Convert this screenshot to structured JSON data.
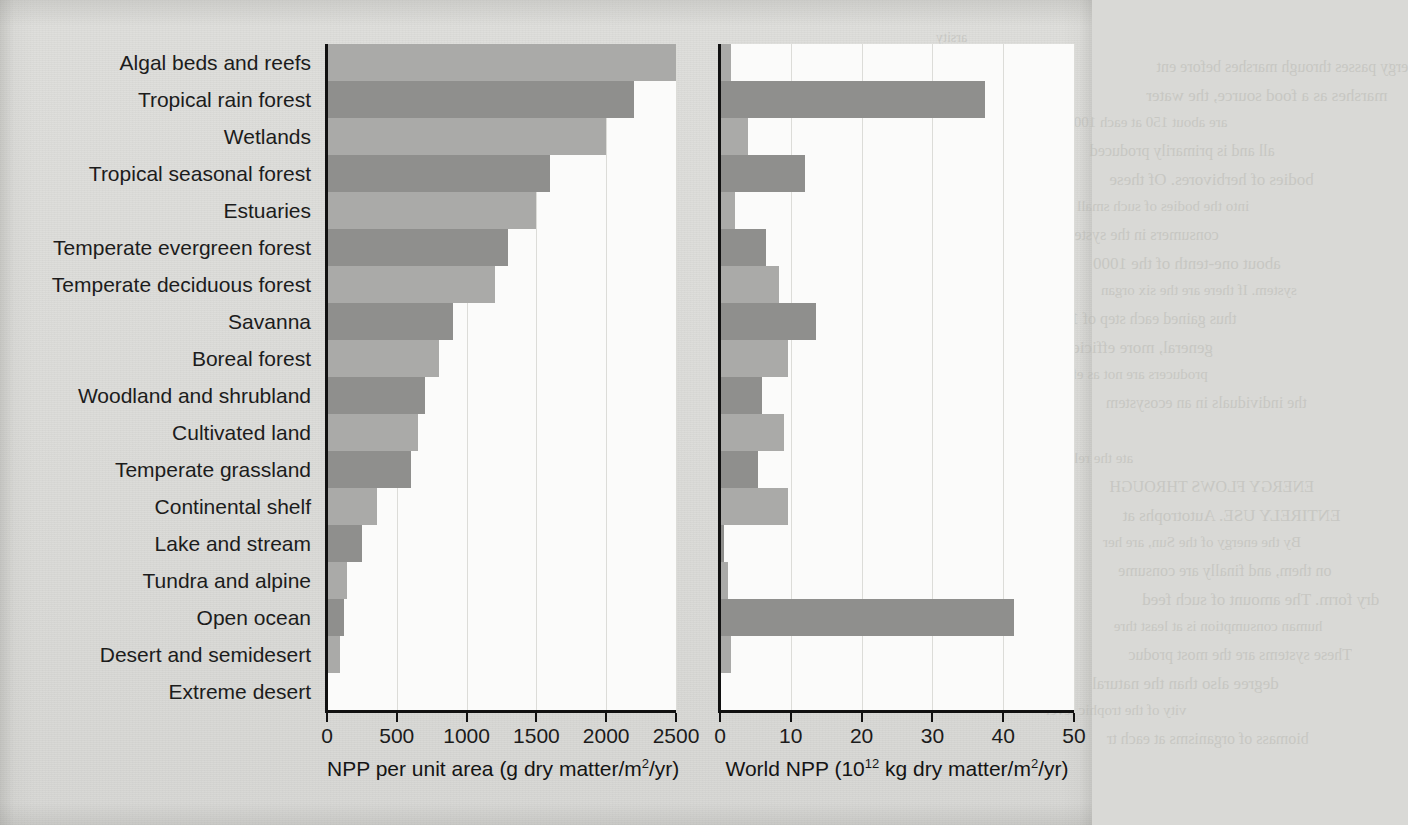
{
  "figure": {
    "background_color": "#dcdcd9",
    "plot_background_color": "#fbfbfa",
    "bar_color_light": "#aaaaa8",
    "bar_color_dark": "#8f8f8d",
    "axis_color": "#111111",
    "gridline_color": "#dcdcd8"
  },
  "ghost_text": [
    "arsity",
    "ergy passes through marshes before ent",
    "marshes as a food source, the water",
    "are about 150 at each 1000",
    "all and is primarily produced",
    "bodies of herbivores. Of these",
    "into the bodies of such small",
    "consumers in the system",
    "about one-tenth of the 1000",
    "system. If there are the six organ",
    "thus gained each step of 1",
    "general, more efficient",
    "producers are not as effic",
    "the individuals in an ecosystem",
    "Figure 5.22",
    "ate the relationship",
    "ENERGY FLOWS THROUGH",
    "ENTIRELY USE. Autotrophs at",
    "By the energy of the Sun, are her",
    "on them, and finally are consume",
    "dry form. The amount of such feed",
    "human consumption is at least thre",
    "These systems are the most produc",
    "degree also than the natural",
    "vity of the trophic level",
    "biomass of organisms at each tr"
  ],
  "chart_data": [
    {
      "type": "bar",
      "orientation": "horizontal",
      "panel": "left",
      "title": "",
      "xlabel": "NPP per unit area (g dry matter/m²/yr)",
      "ylabel": "",
      "xlim": [
        0,
        2500
      ],
      "xticks": [
        0,
        500,
        1000,
        1500,
        2000,
        2500
      ],
      "xticklabels": [
        "0",
        "500",
        "1000",
        "1500",
        "2000",
        "2500"
      ],
      "grid": true,
      "categories": [
        "Algal beds and reefs",
        "Tropical rain forest",
        "Wetlands",
        "Tropical seasonal forest",
        "Estuaries",
        "Temperate evergreen forest",
        "Temperate deciduous forest",
        "Savanna",
        "Boreal forest",
        "Woodland and shrubland",
        "Cultivated land",
        "Temperate grassland",
        "Continental shelf",
        "Lake and stream",
        "Tundra and alpine",
        "Open ocean",
        "Desert and semidesert",
        "Extreme desert"
      ],
      "values": [
        2500,
        2200,
        2000,
        1600,
        1500,
        1300,
        1200,
        900,
        800,
        700,
        650,
        600,
        360,
        250,
        140,
        125,
        90,
        3
      ]
    },
    {
      "type": "bar",
      "orientation": "horizontal",
      "panel": "right",
      "title": "",
      "xlabel": "World NPP (10¹² kg dry matter/m²/yr)",
      "ylabel": "",
      "xlim": [
        0,
        50
      ],
      "xticks": [
        0,
        10,
        20,
        30,
        40,
        50
      ],
      "xticklabels": [
        "0",
        "10",
        "20",
        "30",
        "40",
        "50"
      ],
      "grid": true,
      "categories": [
        "Algal beds and reefs",
        "Tropical rain forest",
        "Wetlands",
        "Tropical seasonal forest",
        "Estuaries",
        "Temperate evergreen forest",
        "Temperate deciduous forest",
        "Savanna",
        "Boreal forest",
        "Woodland and shrubland",
        "Cultivated land",
        "Temperate grassland",
        "Continental shelf",
        "Lake and stream",
        "Tundra and alpine",
        "Open ocean",
        "Desert and semidesert",
        "Extreme desert"
      ],
      "values": [
        1.6,
        37.4,
        4.0,
        12.0,
        2.1,
        6.5,
        8.4,
        13.5,
        9.6,
        6.0,
        9.1,
        5.4,
        9.6,
        0.5,
        1.1,
        41.5,
        1.6,
        0.07
      ]
    }
  ]
}
